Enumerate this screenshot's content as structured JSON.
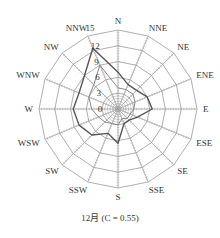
{
  "chart_data": {
    "type": "radar",
    "title": "12月 (C = 0.55)",
    "categories": [
      "N",
      "NNE",
      "NE",
      "ENE",
      "E",
      "ESE",
      "SE",
      "SSE",
      "S",
      "SSW",
      "SW",
      "WSW",
      "W",
      "WNW",
      "NW",
      "NNW"
    ],
    "series": [
      {
        "name": "series-1",
        "values": [
          7,
          5,
          5,
          6,
          6.5,
          4,
          3,
          3,
          6.5,
          5,
          7,
          8,
          8.5,
          8,
          9,
          12.5
        ],
        "color": "#555555"
      },
      {
        "name": "series-2",
        "values": [
          4,
          4,
          4,
          3.5,
          3,
          2.5,
          2.5,
          2,
          3,
          3,
          3.5,
          4,
          5,
          6,
          6.5,
          9
        ],
        "color": "#888888"
      }
    ],
    "radial_ticks": [
      0,
      3,
      6,
      9,
      12,
      15
    ],
    "rlim": [
      0,
      15
    ],
    "grid": true,
    "legend": "none"
  },
  "caption": "12月 (C = 0.55)",
  "geometry": {
    "cx": 118,
    "cy": 109,
    "r_max": 79
  }
}
